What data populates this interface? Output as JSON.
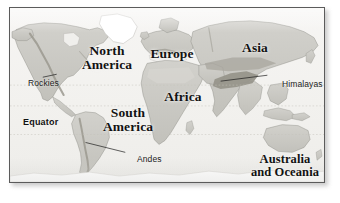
{
  "figure": {
    "kind": "physical world map",
    "caption": "",
    "frame_color": "#5b5b5b",
    "plate_color": "#f2f1ee",
    "land_color": "#c9c8c3",
    "ocean_color": "#f4f3f1",
    "ice_color": "#ffffff",
    "highland_color": "#9b998f",
    "label_color": "#121212",
    "graticule_color": "#c4c2bb"
  },
  "map": {
    "continents": [
      {
        "id": "north-america",
        "label": "North\nAmerica"
      },
      {
        "id": "south-america",
        "label": "South\nAmerica"
      },
      {
        "id": "europe",
        "label": "Europe"
      },
      {
        "id": "africa",
        "label": "Africa"
      },
      {
        "id": "asia",
        "label": "Asia"
      },
      {
        "id": "australia-oceania",
        "label": "Australia\nand Oceania"
      }
    ],
    "features": [
      {
        "id": "rockies",
        "label": "Rockies"
      },
      {
        "id": "himalayas",
        "label": "Himalayas"
      },
      {
        "id": "andes",
        "label": "Andes"
      }
    ],
    "reference_lines": [
      {
        "id": "tropic-of-cancer",
        "label": ""
      },
      {
        "id": "equator",
        "label": "Equator"
      },
      {
        "id": "tropic-of-capricorn",
        "label": ""
      }
    ]
  }
}
